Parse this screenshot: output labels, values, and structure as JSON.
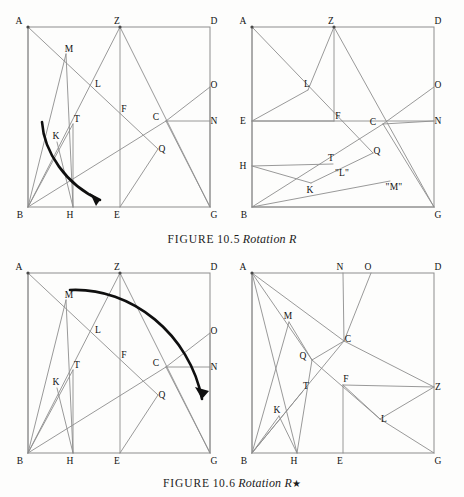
{
  "document": {
    "kind": "book-figure-page",
    "background_color": "#fdfdfc",
    "ink_color": "#8d8d8d",
    "arrow_color": "#0f0f0f"
  },
  "figures": [
    {
      "id": "10.5",
      "caption": {
        "label": "FIGURE",
        "number": "10.5",
        "title": "Rotation R",
        "star": ""
      },
      "panels": [
        {
          "id": "fig105-left",
          "name": "rotation-r-before",
          "square": {
            "x0": 24,
            "y0": 27,
            "x1": 206,
            "y1": 207
          },
          "points": [
            {
              "id": "A",
              "x": 24,
              "y": 27,
              "lx": -9,
              "ly": -3,
              "dot": true
            },
            {
              "id": "Z",
              "x": 116,
              "y": 27,
              "lx": -3,
              "ly": -3,
              "dot": true
            },
            {
              "id": "D",
              "x": 206,
              "y": 27,
              "lx": 4,
              "ly": -3,
              "dot": false
            },
            {
              "id": "M",
              "x": 62,
              "y": 54,
              "lx": 3,
              "ly": -2,
              "dot": false
            },
            {
              "id": "L",
              "x": 91,
              "y": 89,
              "lx": 3,
              "ly": -2,
              "dot": false
            },
            {
              "id": "O",
              "x": 206,
              "y": 87,
              "lx": 4,
              "ly": 1,
              "dot": false
            },
            {
              "id": "F",
              "x": 116,
              "y": 114,
              "lx": 4,
              "ly": -2,
              "dot": false
            },
            {
              "id": "C",
              "x": 162,
              "y": 121,
              "lx": -10,
              "ly": -1,
              "dot": false
            },
            {
              "id": "N",
              "x": 206,
              "y": 121,
              "lx": 4,
              "ly": 3,
              "dot": false
            },
            {
              "id": "T",
              "x": 69,
              "y": 124,
              "lx": 4,
              "ly": -2,
              "dot": false
            },
            {
              "id": "K",
              "x": 53,
              "y": 142,
              "lx": -1,
              "ly": -3,
              "dot": false
            },
            {
              "id": "Q",
              "x": 154,
              "y": 149,
              "lx": 4,
              "ly": 3,
              "dot": false
            },
            {
              "id": "B",
              "x": 24,
              "y": 207,
              "lx": -8,
              "ly": 11,
              "dot": false
            },
            {
              "id": "H",
              "x": 69,
              "y": 207,
              "lx": -3,
              "ly": 11,
              "dot": false
            },
            {
              "id": "E",
              "x": 116,
              "y": 207,
              "lx": -3,
              "ly": 11,
              "dot": false
            },
            {
              "id": "G",
              "x": 206,
              "y": 207,
              "lx": 4,
              "ly": 11,
              "dot": false
            }
          ],
          "segments": [
            [
              "A",
              "Q"
            ],
            [
              "A",
              "B"
            ],
            [
              "Z",
              "B"
            ],
            [
              "Z",
              "E"
            ],
            [
              "Z",
              "G"
            ],
            [
              "M",
              "H"
            ],
            [
              "B",
              "T"
            ],
            [
              "T",
              "H"
            ],
            [
              "B",
              "C"
            ],
            [
              "B",
              "M"
            ],
            [
              "C",
              "O"
            ],
            [
              "C",
              "N"
            ],
            [
              "C",
              "G"
            ],
            [
              "Q",
              "E"
            ],
            [
              "O",
              "G"
            ],
            [
              "K",
              "H"
            ]
          ],
          "arrow": {
            "name": "rotation-arrow-clockwise",
            "path": "M 38 122 C 40 152 62 185 96 200",
            "head": "M 96 200 L 86 193 L 92 206 Z"
          }
        },
        {
          "id": "fig105-right",
          "name": "rotation-r-after",
          "square": {
            "x0": 20,
            "y0": 27,
            "x1": 202,
            "y1": 207
          },
          "points": [
            {
              "id": "A",
              "x": 20,
              "y": 27,
              "lx": -9,
              "ly": -3,
              "dot": true
            },
            {
              "id": "Z",
              "x": 102,
              "y": 27,
              "lx": -3,
              "ly": -3,
              "dot": true
            },
            {
              "id": "D",
              "x": 202,
              "y": 27,
              "lx": 4,
              "ly": -3,
              "dot": false
            },
            {
              "id": "L",
              "x": 76,
              "y": 90,
              "lx": -1,
              "ly": -3,
              "dot": false
            },
            {
              "id": "O",
              "x": 202,
              "y": 87,
              "lx": 4,
              "ly": 1,
              "dot": false
            },
            {
              "id": "E",
              "x": 20,
              "y": 121,
              "lx": -9,
              "ly": 3,
              "dot": false
            },
            {
              "id": "F",
              "x": 102,
              "y": 121,
              "lx": 4,
              "ly": -2,
              "dot": false
            },
            {
              "id": "C",
              "x": 151,
              "y": 124,
              "lx": -10,
              "ly": 1,
              "dot": false
            },
            {
              "id": "N",
              "x": 202,
              "y": 121,
              "lx": 4,
              "ly": 3,
              "dot": false
            },
            {
              "id": "Q",
              "x": 141,
              "y": 153,
              "lx": 4,
              "ly": 1,
              "dot": false
            },
            {
              "id": "H",
              "x": 20,
              "y": 166,
              "lx": -9,
              "ly": 3,
              "dot": false
            },
            {
              "id": "T",
              "x": 101,
              "y": 164,
              "lx": -2,
              "ly": -3,
              "dot": false
            },
            {
              "id": "K",
              "x": 79,
              "y": 183,
              "lx": -1,
              "ly": 10,
              "dot": false
            },
            {
              "id": "B",
              "x": 20,
              "y": 207,
              "lx": -8,
              "ly": 11,
              "dot": false
            },
            {
              "id": "G",
              "x": 202,
              "y": 207,
              "lx": 4,
              "ly": 11,
              "dot": false
            }
          ],
          "quoted_labels": [
            {
              "text": "\"L\"",
              "x": 110,
              "y": 176
            },
            {
              "text": "\"M\"",
              "x": 162,
              "y": 190
            }
          ],
          "segments": [
            [
              "A",
              "Q"
            ],
            [
              "A",
              "B"
            ],
            [
              "Z",
              "L"
            ],
            [
              "Z",
              "F"
            ],
            [
              "Z",
              "G"
            ],
            [
              "E",
              "L"
            ],
            [
              "E",
              "F"
            ],
            [
              "E",
              "N"
            ],
            [
              "C",
              "O"
            ],
            [
              "C",
              "N"
            ],
            [
              "C",
              "G"
            ],
            [
              "C",
              "B"
            ],
            [
              "H",
              "T"
            ],
            [
              "H",
              "K"
            ],
            [
              "K",
              "Q"
            ],
            [
              "B",
              "G"
            ],
            [
              "B",
              "W1"
            ]
          ],
          "extra_segments": [
            {
              "from": {
                "x": 20,
                "y": 207
              },
              "to": {
                "x": 158,
                "y": 181
              },
              "name": "segment-b-to-quoted-m"
            }
          ],
          "arrow": null
        }
      ]
    },
    {
      "id": "10.6",
      "caption": {
        "label": "FIGURE",
        "number": "10.6",
        "title": "Rotation R",
        "star": "★"
      },
      "panels": [
        {
          "id": "fig106-left",
          "name": "rotation-r-star-before",
          "square": {
            "x0": 24,
            "y0": 20,
            "x1": 206,
            "y1": 200
          },
          "points": [
            {
              "id": "A",
              "x": 24,
              "y": 20,
              "lx": -9,
              "ly": -3,
              "dot": true
            },
            {
              "id": "Z",
              "x": 116,
              "y": 20,
              "lx": -3,
              "ly": -3,
              "dot": true
            },
            {
              "id": "D",
              "x": 206,
              "y": 20,
              "lx": 4,
              "ly": -3,
              "dot": false
            },
            {
              "id": "M",
              "x": 62,
              "y": 47,
              "lx": 3,
              "ly": -2,
              "dot": false
            },
            {
              "id": "L",
              "x": 91,
              "y": 82,
              "lx": 3,
              "ly": -2,
              "dot": false
            },
            {
              "id": "O",
              "x": 206,
              "y": 80,
              "lx": 4,
              "ly": 1,
              "dot": false
            },
            {
              "id": "F",
              "x": 116,
              "y": 107,
              "lx": 4,
              "ly": -2,
              "dot": false
            },
            {
              "id": "C",
              "x": 162,
              "y": 114,
              "lx": -10,
              "ly": -1,
              "dot": false
            },
            {
              "id": "N",
              "x": 206,
              "y": 114,
              "lx": 4,
              "ly": 3,
              "dot": false
            },
            {
              "id": "T",
              "x": 69,
              "y": 117,
              "lx": 4,
              "ly": -2,
              "dot": false
            },
            {
              "id": "K",
              "x": 53,
              "y": 135,
              "lx": -1,
              "ly": -3,
              "dot": false
            },
            {
              "id": "Q",
              "x": 154,
              "y": 142,
              "lx": 4,
              "ly": 3,
              "dot": false
            },
            {
              "id": "B",
              "x": 24,
              "y": 200,
              "lx": -8,
              "ly": 11,
              "dot": false
            },
            {
              "id": "H",
              "x": 69,
              "y": 200,
              "lx": -3,
              "ly": 11,
              "dot": false
            },
            {
              "id": "E",
              "x": 116,
              "y": 200,
              "lx": -3,
              "ly": 11,
              "dot": false
            },
            {
              "id": "G",
              "x": 206,
              "y": 200,
              "lx": 4,
              "ly": 11,
              "dot": false
            }
          ],
          "segments": [
            [
              "A",
              "Q"
            ],
            [
              "A",
              "B"
            ],
            [
              "Z",
              "B"
            ],
            [
              "Z",
              "E"
            ],
            [
              "Z",
              "G"
            ],
            [
              "M",
              "H"
            ],
            [
              "B",
              "T"
            ],
            [
              "T",
              "H"
            ],
            [
              "B",
              "C"
            ],
            [
              "B",
              "M"
            ],
            [
              "C",
              "O"
            ],
            [
              "C",
              "N"
            ],
            [
              "C",
              "G"
            ],
            [
              "Q",
              "E"
            ],
            [
              "O",
              "G"
            ],
            [
              "K",
              "H"
            ]
          ],
          "arrow": {
            "name": "rotation-arrow-star-clockwise",
            "path": "M 66 37 C 128 34 186 82 198 146",
            "head": "M 198 146 L 191 134 L 205 138 Z"
          }
        },
        {
          "id": "fig106-right",
          "name": "rotation-r-star-after",
          "square": {
            "x0": 20,
            "y0": 20,
            "x1": 202,
            "y1": 200
          },
          "points": [
            {
              "id": "A",
              "x": 20,
              "y": 20,
              "lx": -9,
              "ly": -3,
              "dot": true
            },
            {
              "id": "N",
              "x": 111,
              "y": 20,
              "lx": -3,
              "ly": -3,
              "dot": false
            },
            {
              "id": "O",
              "x": 139,
              "y": 20,
              "lx": -3,
              "ly": -3,
              "dot": false
            },
            {
              "id": "D",
              "x": 202,
              "y": 20,
              "lx": 4,
              "ly": -3,
              "dot": false
            },
            {
              "id": "M",
              "x": 57,
              "y": 69,
              "lx": -1,
              "ly": -3,
              "dot": false
            },
            {
              "id": "C",
              "x": 112,
              "y": 88,
              "lx": 4,
              "ly": 1,
              "dot": false
            },
            {
              "id": "Q",
              "x": 80,
              "y": 107,
              "lx": -9,
              "ly": -1,
              "dot": false
            },
            {
              "id": "F",
              "x": 111,
              "y": 132,
              "lx": 3,
              "ly": -3,
              "dot": false
            },
            {
              "id": "Z",
              "x": 202,
              "y": 134,
              "lx": 4,
              "ly": 3,
              "dot": false
            },
            {
              "id": "T",
              "x": 71,
              "y": 138,
              "lx": 3,
              "ly": -2,
              "dot": false
            },
            {
              "id": "K",
              "x": 47,
              "y": 163,
              "lx": -2,
              "ly": -3,
              "dot": false
            },
            {
              "id": "L",
              "x": 148,
              "y": 166,
              "lx": 4,
              "ly": 3,
              "dot": false
            },
            {
              "id": "B",
              "x": 20,
              "y": 200,
              "lx": -8,
              "ly": 11,
              "dot": false
            },
            {
              "id": "H",
              "x": 65,
              "y": 200,
              "lx": -3,
              "ly": 11,
              "dot": false
            },
            {
              "id": "E",
              "x": 111,
              "y": 200,
              "lx": -3,
              "ly": 11,
              "dot": false
            },
            {
              "id": "G",
              "x": 202,
              "y": 200,
              "lx": 4,
              "ly": 11,
              "dot": false
            }
          ],
          "segments": [
            [
              "A",
              "B"
            ],
            [
              "A",
              "Q"
            ],
            [
              "A",
              "C"
            ],
            [
              "A",
              "H"
            ],
            [
              "N",
              "C"
            ],
            [
              "O",
              "C"
            ],
            [
              "C",
              "Z"
            ],
            [
              "C",
              "Q"
            ],
            [
              "C",
              "B"
            ],
            [
              "Q",
              "L"
            ],
            [
              "Q",
              "H"
            ],
            [
              "F",
              "E"
            ],
            [
              "F",
              "Z"
            ],
            [
              "F",
              "L"
            ],
            [
              "L",
              "Z"
            ],
            [
              "L",
              "G"
            ],
            [
              "B",
              "K"
            ],
            [
              "K",
              "H"
            ],
            [
              "B",
              "M"
            ],
            [
              "M",
              "Q"
            ],
            [
              "B",
              "T"
            ]
          ],
          "arrow": null
        }
      ]
    }
  ]
}
